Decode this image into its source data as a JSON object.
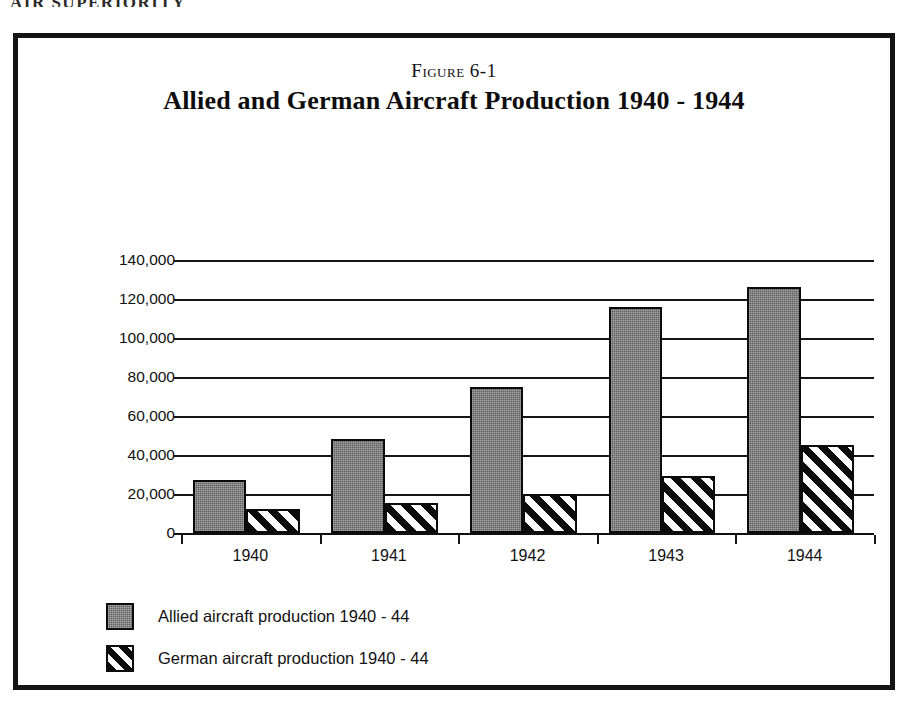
{
  "page": {
    "header_text": "AIR SUPERIORITY"
  },
  "figure": {
    "number_label": "Figure 6-1",
    "title": "Allied and German Aircraft Production 1940 - 1944"
  },
  "colors": {
    "allied_fill": "#7a7a7a",
    "german_fill": "#ffffff",
    "ink": "#111111",
    "frame": "#141414"
  },
  "chart_data": {
    "type": "bar",
    "title": "Allied and German Aircraft Production 1940 - 1944",
    "subtitle": "Figure 6-1",
    "xlabel": "",
    "ylabel": "",
    "categories": [
      "1940",
      "1941",
      "1942",
      "1943",
      "1944"
    ],
    "series": [
      {
        "name": "Allied aircraft production 1940 - 44",
        "values": [
          27000,
          48000,
          75000,
          116000,
          126000
        ]
      },
      {
        "name": "German aircraft production 1940 - 44",
        "values": [
          12500,
          15500,
          20000,
          29000,
          45000
        ]
      }
    ],
    "ylim": [
      0,
      140000
    ],
    "ytick_values": [
      0,
      20000,
      40000,
      60000,
      80000,
      100000,
      120000,
      140000
    ],
    "ytick_labels": [
      "0",
      "20,000",
      "40,000",
      "60,000",
      "80,000",
      "100,000",
      "120,000",
      "140,000"
    ],
    "grid": true,
    "grid_axis": "y",
    "legend_position": "bottom-left"
  },
  "legend": {
    "items": [
      {
        "label": "Allied aircraft production 1940 - 44",
        "style": "solid-gray"
      },
      {
        "label": "German aircraft production 1940 - 44",
        "style": "diagonal-hatch"
      }
    ]
  }
}
